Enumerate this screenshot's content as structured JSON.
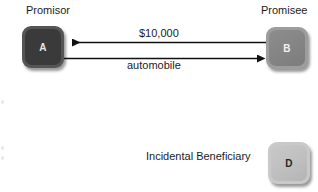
{
  "diagram": {
    "type": "contract-relationship",
    "background_color": "#ffffff",
    "nodes": [
      {
        "id": "A",
        "letter": "A",
        "role_label": "Promisor",
        "fill_color": "#3a3a3a",
        "text_color": "#e8e8e8",
        "shape": "rounded-square",
        "x": 22,
        "y": 26,
        "w": 42,
        "h": 42
      },
      {
        "id": "B",
        "letter": "B",
        "role_label": "Promisee",
        "fill_color": "#848484",
        "text_color": "#f2f2f2",
        "shape": "rounded-square",
        "x": 266,
        "y": 27,
        "w": 42,
        "h": 42
      },
      {
        "id": "D",
        "letter": "D",
        "role_label": "Incidental Beneficiary",
        "fill_color": "#bfbfbf",
        "text_color": "#262626",
        "shape": "rounded-square",
        "x": 268,
        "y": 142,
        "w": 42,
        "h": 42
      }
    ],
    "edges": [
      {
        "id": "edge-money",
        "label": "$10,000",
        "from": "B",
        "to": "A",
        "direction": "right-to-left",
        "arrowhead": "left",
        "color": "#111111"
      },
      {
        "id": "edge-automobile",
        "label": "automobile",
        "from": "A",
        "to": "B",
        "direction": "left-to-right",
        "arrowhead": "right",
        "color": "#111111"
      }
    ],
    "labels": {
      "promisor": "Promisor",
      "promisee": "Promisee",
      "amount": "$10,000",
      "consideration": "automobile",
      "incidental_beneficiary": "Incidental Beneficiary"
    }
  }
}
